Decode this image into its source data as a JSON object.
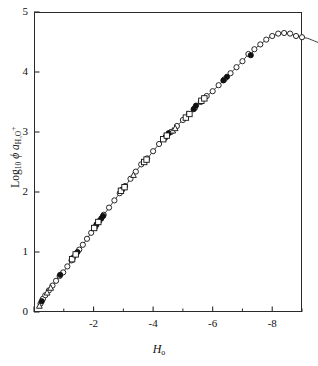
{
  "chart_data": {
    "type": "scatter",
    "title": "",
    "xlabel": "H₀",
    "xlabel_main": "H",
    "xlabel_sub": "o",
    "ylabel": "Log₁₀ ϕ a_H₃O⁺",
    "ylabel_parts": {
      "log": "Log",
      "log_sub": "10",
      "phi": "ϕ",
      "a": "a",
      "a_sub": "H₃O",
      "a_sup": "+"
    },
    "xlim": [
      0,
      -9
    ],
    "ylim": [
      0,
      5
    ],
    "x_major_ticks": [
      0,
      -2,
      -4,
      -6,
      -8
    ],
    "x_major_tick_labels": [
      "",
      "-2",
      "-4",
      "-6",
      "-8"
    ],
    "x_minor_ticks": [
      -1,
      -3,
      -5,
      -7,
      -9
    ],
    "y_major_ticks": [
      0,
      1,
      2,
      3,
      4,
      5
    ],
    "y_major_tick_labels": [
      "0",
      "1",
      "2",
      "3",
      "4",
      "5"
    ],
    "grid": false,
    "legend": "none",
    "axis_direction": "x-axis reversed (0 at left, -9 at right)",
    "curve_description": "Monotonic rise from origin, peak near H0 = -7.5 at 4.65, then decline to 4.42 at H0 = -9",
    "series": [
      {
        "name": "open-circle",
        "marker": "open circle",
        "fill": "#ffffff",
        "stroke": "#111111",
        "points": [
          [
            -0.22,
            0.14
          ],
          [
            -0.3,
            0.22
          ],
          [
            -0.38,
            0.28
          ],
          [
            -0.5,
            0.36
          ],
          [
            -0.62,
            0.44
          ],
          [
            -0.74,
            0.52
          ],
          [
            -0.86,
            0.6
          ],
          [
            -0.98,
            0.66
          ],
          [
            -1.12,
            0.76
          ],
          [
            -1.26,
            0.86
          ],
          [
            -1.4,
            0.96
          ],
          [
            -1.52,
            1.04
          ],
          [
            -1.64,
            1.12
          ],
          [
            -1.78,
            1.22
          ],
          [
            -1.92,
            1.32
          ],
          [
            -2.06,
            1.42
          ],
          [
            -2.2,
            1.52
          ],
          [
            -2.34,
            1.62
          ],
          [
            -2.52,
            1.74
          ],
          [
            -2.7,
            1.86
          ],
          [
            -2.88,
            1.98
          ],
          [
            -3.06,
            2.1
          ],
          [
            -3.24,
            2.22
          ],
          [
            -3.42,
            2.34
          ],
          [
            -3.6,
            2.46
          ],
          [
            -3.8,
            2.56
          ],
          [
            -4.0,
            2.68
          ],
          [
            -4.2,
            2.8
          ],
          [
            -4.4,
            2.9
          ],
          [
            -4.6,
            3.0
          ],
          [
            -4.8,
            3.1
          ],
          [
            -5.0,
            3.2
          ],
          [
            -5.2,
            3.3
          ],
          [
            -5.4,
            3.4
          ],
          [
            -5.6,
            3.5
          ],
          [
            -5.8,
            3.6
          ],
          [
            -6.0,
            3.68
          ],
          [
            -6.2,
            3.78
          ],
          [
            -6.4,
            3.88
          ],
          [
            -6.6,
            3.98
          ],
          [
            -6.8,
            4.08
          ],
          [
            -7.0,
            4.18
          ],
          [
            -7.2,
            4.3
          ],
          [
            -7.4,
            4.38
          ],
          [
            -7.6,
            4.46
          ],
          [
            -7.8,
            4.54
          ],
          [
            -8.0,
            4.6
          ],
          [
            -8.2,
            4.64
          ],
          [
            -8.4,
            4.65
          ],
          [
            -8.6,
            4.64
          ],
          [
            -8.8,
            4.6
          ],
          [
            -9.0,
            4.58
          ],
          [
            -9.2,
            4.56
          ],
          [
            -9.4,
            4.52
          ],
          [
            -9.6,
            4.48
          ],
          [
            -9.8,
            4.42
          ]
        ]
      },
      {
        "name": "filled-circle",
        "marker": "filled circle",
        "fill": "#111111",
        "stroke": "#111111",
        "points": [
          [
            -0.26,
            0.18
          ],
          [
            -0.88,
            0.62
          ],
          [
            -1.3,
            0.9
          ],
          [
            -1.46,
            1.0
          ],
          [
            -2.1,
            1.46
          ],
          [
            -2.26,
            1.56
          ],
          [
            -2.32,
            1.6
          ],
          [
            -2.96,
            2.04
          ],
          [
            -4.42,
            2.92
          ],
          [
            -4.52,
            2.98
          ],
          [
            -5.36,
            3.38
          ],
          [
            -5.44,
            3.44
          ],
          [
            -6.36,
            3.86
          ],
          [
            -6.48,
            3.92
          ],
          [
            -7.28,
            4.28
          ]
        ]
      },
      {
        "name": "square",
        "marker": "open square",
        "fill": "#ffffff",
        "stroke": "#111111",
        "points": [
          [
            -1.28,
            0.88
          ],
          [
            -1.4,
            0.96
          ],
          [
            -2.02,
            1.4
          ],
          [
            -2.16,
            1.5
          ],
          [
            -2.92,
            2.02
          ],
          [
            -3.04,
            2.08
          ],
          [
            -3.7,
            2.5
          ],
          [
            -3.78,
            2.54
          ],
          [
            -4.34,
            2.88
          ],
          [
            -4.46,
            2.94
          ],
          [
            -5.1,
            3.24
          ],
          [
            -5.22,
            3.3
          ],
          [
            -5.62,
            3.52
          ],
          [
            -5.72,
            3.56
          ]
        ]
      },
      {
        "name": "triangle",
        "marker": "open triangle",
        "fill": "#ffffff",
        "stroke": "#111111",
        "points": [
          [
            -0.18,
            0.1
          ],
          [
            -0.44,
            0.32
          ],
          [
            -0.56,
            0.4
          ],
          [
            -3.34,
            2.28
          ],
          [
            -4.66,
            3.02
          ],
          [
            -4.74,
            3.06
          ]
        ]
      }
    ]
  }
}
